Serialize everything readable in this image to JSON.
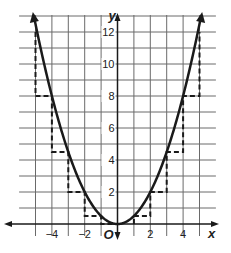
{
  "figure": {
    "type": "graph",
    "function": "y = x^2 / 2",
    "x_axis_label": "x",
    "y_axis_label": "y",
    "origin_label": "O",
    "x_tick_labels": [
      "−4",
      "−2",
      "2",
      "4"
    ],
    "y_tick_labels": [
      "2",
      "4",
      "6",
      "8",
      "10",
      "12"
    ],
    "grid": {
      "x_range": [
        -6,
        6
      ],
      "y_range": [
        -0.5,
        13
      ],
      "step": 1
    },
    "colors": {
      "curve": "#1a1a1a",
      "grid": "#555555",
      "dashed": "#1a1a1a"
    }
  },
  "chart_data": {
    "type": "line",
    "title": "",
    "xlabel": "x",
    "ylabel": "y",
    "xlim": [
      -6,
      6
    ],
    "ylim": [
      0,
      13
    ],
    "grid": true,
    "series": [
      {
        "name": "parabola y = x²/2",
        "x": [
          -5,
          -4,
          -3,
          -2,
          -1,
          0,
          1,
          2,
          3,
          4,
          5
        ],
        "values": [
          12.5,
          8,
          4.5,
          2,
          0.5,
          0,
          0.5,
          2,
          4.5,
          8,
          12.5
        ]
      },
      {
        "name": "step approximation (dashed)",
        "x": [
          -5,
          -4,
          -3,
          -2,
          -1,
          0,
          1,
          2,
          3,
          4,
          5
        ],
        "values": [
          12,
          8,
          4.5,
          2,
          0.5,
          0,
          0.5,
          2,
          4.5,
          8,
          12
        ]
      }
    ]
  }
}
